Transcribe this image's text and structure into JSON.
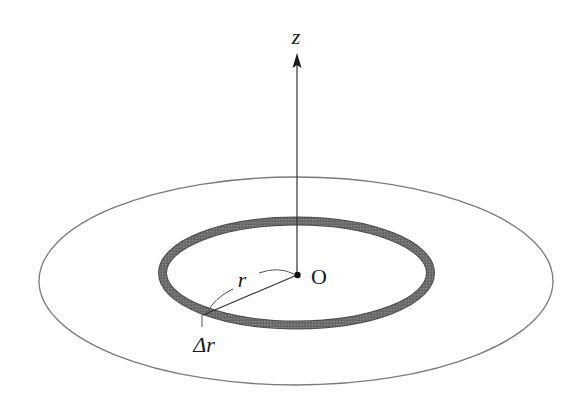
{
  "diagram": {
    "type": "annular ring on a disk with vertical axis",
    "labels": {
      "axis": "z",
      "origin": "O",
      "radius": "r",
      "thickness": "Δr"
    },
    "colors": {
      "background": "#ffffff",
      "outer_ellipse_stroke": "#7a7a7a",
      "ring_fill": "#6e6e6e",
      "ring_edge": "#4a4a4a",
      "lines": "#333333",
      "text": "#1a1a1a"
    },
    "elements": [
      {
        "name": "outer-disk-edge",
        "shape": "ellipse",
        "cx": 296,
        "cy": 281,
        "rx": 257,
        "ry": 104
      },
      {
        "name": "annular-ring",
        "shape": "ellipse",
        "cx": 296.5,
        "cy": 273,
        "rx": 134,
        "ry": 52,
        "thickness": 8
      },
      {
        "name": "z-axis",
        "shape": "arrow",
        "from": [
          297,
          275
        ],
        "to": [
          297,
          53
        ]
      },
      {
        "name": "origin-point",
        "shape": "dot",
        "at": [
          297,
          275
        ]
      },
      {
        "name": "radius-line",
        "shape": "line",
        "from": [
          297,
          275
        ],
        "to": [
          203,
          315
        ]
      }
    ]
  }
}
